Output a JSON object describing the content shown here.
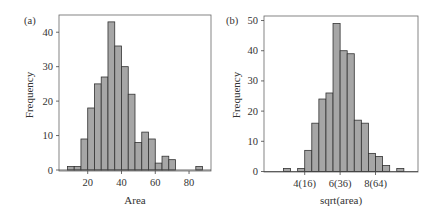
{
  "chart_data": [
    {
      "type": "bar",
      "panel": "(a)",
      "title": "",
      "xlabel": "Area",
      "ylabel": "Frequency",
      "bin_width": 4,
      "bin_starts": [
        8,
        12,
        16,
        20,
        24,
        28,
        32,
        36,
        40,
        44,
        48,
        52,
        56,
        60,
        64,
        68,
        72,
        76,
        80,
        84
      ],
      "values": [
        1,
        1,
        9,
        18,
        25,
        27,
        43,
        36,
        30,
        22,
        8,
        11,
        9,
        2,
        4,
        3,
        0,
        0,
        0,
        1
      ],
      "xticks": [
        20,
        40,
        60,
        80
      ],
      "xtick_labels": [
        "20",
        "40",
        "60",
        "80"
      ],
      "yticks": [
        0,
        10,
        20,
        30,
        40
      ],
      "ytick_labels": [
        "0",
        "10",
        "20",
        "30",
        "40"
      ],
      "xlim": [
        3,
        93
      ],
      "ylim": [
        0,
        45
      ],
      "grid": false,
      "bar_color": "#a6a6a6",
      "edge_color": "#333333"
    },
    {
      "type": "bar",
      "panel": "(b)",
      "title": "",
      "xlabel": "sqrt(area)",
      "ylabel": "Frequency",
      "bin_width": 0.4,
      "bin_starts": [
        2.8,
        3.2,
        3.6,
        4.0,
        4.4,
        4.8,
        5.2,
        5.6,
        6.0,
        6.4,
        6.8,
        7.2,
        7.6,
        8.0,
        8.4,
        8.8,
        9.2
      ],
      "values": [
        1,
        0,
        1,
        7,
        16,
        24,
        26,
        49,
        40,
        39,
        17,
        16,
        6,
        5,
        2,
        0,
        1
      ],
      "xticks": [
        4,
        6,
        8
      ],
      "xtick_labels": [
        "4(16)",
        "6(36)",
        "8(64)"
      ],
      "yticks": [
        0,
        10,
        20,
        30,
        40,
        50
      ],
      "ytick_labels": [
        "0",
        "10",
        "20",
        "30",
        "40",
        "50"
      ],
      "xlim": [
        1.7,
        10.4
      ],
      "ylim": [
        0,
        51.5
      ],
      "grid": false,
      "bar_color": "#a6a6a6",
      "edge_color": "#333333"
    }
  ]
}
